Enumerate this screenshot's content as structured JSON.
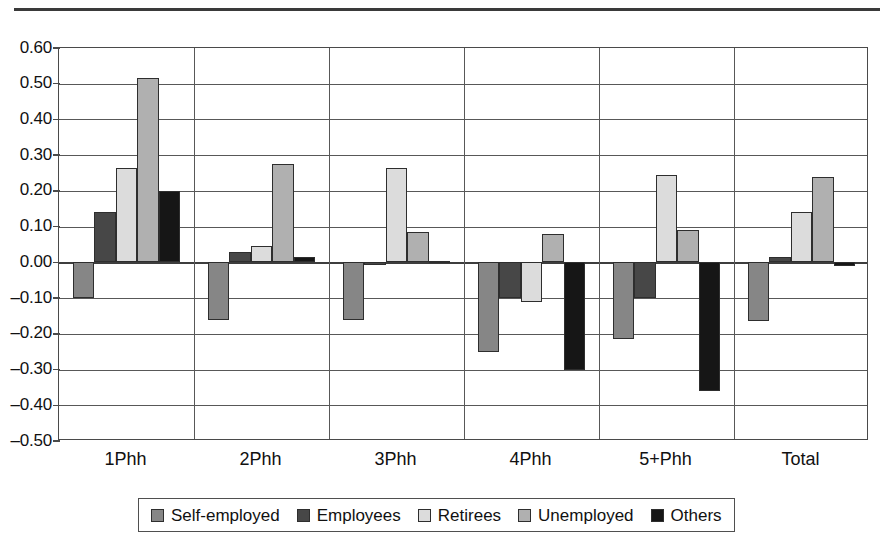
{
  "chart_data": {
    "type": "bar",
    "title": "",
    "subtitle": "",
    "xlabel": "",
    "ylabel": "",
    "categories": [
      "1Phh",
      "2Phh",
      "3Phh",
      "4Phh",
      "5+Phh",
      "Total"
    ],
    "series": [
      {
        "name": "Self-employed",
        "color": "#868686",
        "values": [
          -0.1,
          -0.16,
          -0.16,
          -0.25,
          -0.215,
          -0.165
        ]
      },
      {
        "name": "Employees",
        "color": "#474747",
        "values": [
          0.14,
          0.03,
          -0.005,
          -0.1,
          -0.1,
          0.015
        ]
      },
      {
        "name": "Retirees",
        "color": "#dcdcdc",
        "values": [
          0.265,
          0.045,
          0.265,
          -0.11,
          0.245,
          0.14
        ]
      },
      {
        "name": "Unemployed",
        "color": "#b0b0b0",
        "values": [
          0.517,
          0.275,
          0.085,
          0.08,
          0.09,
          0.24
        ]
      },
      {
        "name": "Others",
        "color": "#161616",
        "values": [
          0.2,
          0.015,
          0.005,
          -0.3,
          -0.36,
          -0.01
        ]
      }
    ],
    "ylim": [
      -0.5,
      0.6
    ],
    "ytick_values": [
      0.6,
      0.5,
      0.4,
      0.3,
      0.2,
      0.1,
      0.0,
      -0.1,
      -0.2,
      -0.3,
      -0.4,
      -0.5
    ],
    "ytick_labels": [
      "0.60",
      "0.50",
      "0.40",
      "0.30",
      "0.20",
      "0.10",
      "0.00",
      "-0.10",
      "-0.20",
      "-0.30",
      "-0.40",
      "-0.50"
    ],
    "grid": true,
    "grid_axis": "y",
    "legend_position": "bottom",
    "group_separators": true
  },
  "legend": {
    "entries": [
      {
        "label": "Self-employed",
        "swatch": "#868686"
      },
      {
        "label": "Employees",
        "swatch": "#474747"
      },
      {
        "label": "Retirees",
        "swatch": "#dcdcdc"
      },
      {
        "label": "Unemployed",
        "swatch": "#b0b0b0"
      },
      {
        "label": "Others",
        "swatch": "#161616"
      }
    ]
  }
}
